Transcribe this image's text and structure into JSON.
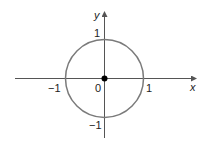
{
  "diagram": {
    "type": "unit-circle",
    "axes": {
      "x_label": "x",
      "y_label": "y"
    },
    "tick_labels": {
      "x_neg": "−1",
      "x_pos": "1",
      "origin": "0",
      "y_pos": "1",
      "y_neg": "−1"
    },
    "circle": {
      "center": [
        0,
        0
      ],
      "radius": 1,
      "color": "#7a7a7a"
    },
    "origin_point": {
      "x": 0,
      "y": 0,
      "color": "#000000"
    },
    "axis_color": "#555555"
  }
}
